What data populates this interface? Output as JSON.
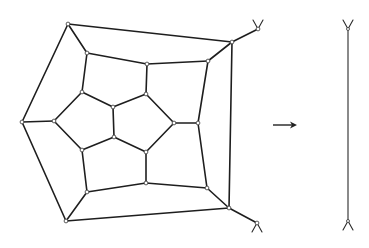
{
  "diagram": {
    "colors": {
      "stroke": "#1e1e1e",
      "vertex_fill": "#ffffff",
      "background": "#ffffff"
    },
    "vertices": [
      {
        "id": "A",
        "x": 68,
        "y": 24
      },
      {
        "id": "B",
        "x": 22,
        "y": 122
      },
      {
        "id": "C",
        "x": 66,
        "y": 221
      },
      {
        "id": "D",
        "x": 229,
        "y": 208
      },
      {
        "id": "E",
        "x": 232,
        "y": 42
      },
      {
        "id": "r1",
        "x": 87,
        "y": 53
      },
      {
        "id": "r2",
        "x": 147,
        "y": 64
      },
      {
        "id": "r3",
        "x": 208,
        "y": 61
      },
      {
        "id": "r4",
        "x": 198,
        "y": 123
      },
      {
        "id": "r5",
        "x": 207,
        "y": 188
      },
      {
        "id": "r6",
        "x": 146,
        "y": 183
      },
      {
        "id": "r7",
        "x": 87,
        "y": 192
      },
      {
        "id": "r8",
        "x": 82,
        "y": 150
      },
      {
        "id": "r9",
        "x": 54,
        "y": 121
      },
      {
        "id": "r10",
        "x": 82,
        "y": 92
      },
      {
        "id": "p1",
        "x": 113,
        "y": 107
      },
      {
        "id": "p2",
        "x": 146,
        "y": 94
      },
      {
        "id": "p3",
        "x": 174,
        "y": 123
      },
      {
        "id": "p4",
        "x": 146,
        "y": 152
      },
      {
        "id": "p5",
        "x": 114,
        "y": 137
      },
      {
        "id": "t1",
        "x": 258,
        "y": 29
      },
      {
        "id": "t2",
        "x": 257,
        "y": 223
      }
    ],
    "edges": [
      [
        "A",
        "B"
      ],
      [
        "B",
        "C"
      ],
      [
        "C",
        "D"
      ],
      [
        "D",
        "E"
      ],
      [
        "E",
        "A"
      ],
      [
        "A",
        "r1"
      ],
      [
        "E",
        "r3"
      ],
      [
        "D",
        "r5"
      ],
      [
        "C",
        "r7"
      ],
      [
        "B",
        "r9"
      ],
      [
        "r1",
        "r2"
      ],
      [
        "r2",
        "r3"
      ],
      [
        "r3",
        "r4"
      ],
      [
        "r4",
        "r5"
      ],
      [
        "r5",
        "r6"
      ],
      [
        "r6",
        "r7"
      ],
      [
        "r7",
        "r8"
      ],
      [
        "r8",
        "r9"
      ],
      [
        "r9",
        "r10"
      ],
      [
        "r10",
        "r1"
      ],
      [
        "r2",
        "p2"
      ],
      [
        "r4",
        "p3"
      ],
      [
        "r6",
        "p4"
      ],
      [
        "r8",
        "p5"
      ],
      [
        "r10",
        "p1"
      ],
      [
        "p1",
        "p2"
      ],
      [
        "p2",
        "p3"
      ],
      [
        "p3",
        "p4"
      ],
      [
        "p4",
        "p5"
      ],
      [
        "p5",
        "p1"
      ],
      [
        "E",
        "t1"
      ],
      [
        "D",
        "t2"
      ]
    ],
    "half_edges": [
      {
        "at": "t1",
        "direction": "up"
      },
      {
        "at": "t2",
        "direction": "down"
      }
    ],
    "arrow": {
      "x1": 273,
      "y1": 125,
      "x2": 297,
      "y2": 125,
      "label": "→"
    },
    "result_segment": {
      "x": 348,
      "y1": 29,
      "y2": 221
    }
  }
}
